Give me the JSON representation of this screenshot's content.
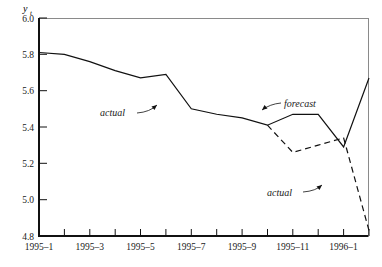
{
  "chart_data": {
    "type": "line",
    "title": "",
    "subtitle": "",
    "xlabel": "",
    "ylabel": "y_t",
    "ylabel_main": "y",
    "ylabel_sub": "t",
    "ylim": [
      4.8,
      6.0
    ],
    "yticks": [
      "6.0",
      "5.8",
      "5.6",
      "5.4",
      "5.2",
      "5.0",
      "4.8"
    ],
    "ytick_values": [
      6.0,
      5.8,
      5.6,
      5.4,
      5.2,
      5.0,
      4.8
    ],
    "xticks": [
      "1995–1",
      "1995–3",
      "1995–5",
      "1995–7",
      "1995–9",
      "1995–11",
      "1996–1"
    ],
    "xtick_values": [
      1,
      3,
      5,
      7,
      9,
      11,
      13
    ],
    "x_all_months": [
      1,
      2,
      3,
      4,
      5,
      6,
      7,
      8,
      9,
      10,
      11,
      12,
      13,
      14
    ],
    "xlim": [
      1,
      14
    ],
    "grid": false,
    "legend": "annotations",
    "series": [
      {
        "name": "forecast",
        "style": "solid",
        "color": "#111111",
        "x": [
          1,
          2,
          3,
          4,
          5,
          6,
          7,
          8,
          9,
          10,
          11,
          12,
          13,
          14
        ],
        "values": [
          5.81,
          5.8,
          5.76,
          5.71,
          5.67,
          5.69,
          5.5,
          5.47,
          5.45,
          5.41,
          5.47,
          5.47,
          5.29,
          5.67
        ]
      },
      {
        "name": "actual",
        "style": "dashed",
        "color": "#111111",
        "x": [
          10,
          11,
          12,
          13,
          14
        ],
        "values": [
          5.41,
          5.26,
          5.3,
          5.34,
          4.83
        ]
      }
    ],
    "annotations": [
      {
        "text": "actual",
        "name": "annotation-actual-solid",
        "x": 5.6,
        "y": 5.4
      },
      {
        "text": "forecast",
        "name": "annotation-forecast",
        "x": 10.9,
        "y": 5.59
      },
      {
        "text": "actual",
        "name": "annotation-actual-dashed",
        "x": 11.7,
        "y": 5.07
      }
    ]
  }
}
